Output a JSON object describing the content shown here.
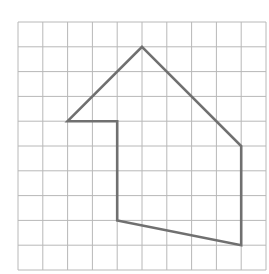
{
  "diagram": {
    "type": "grid-polygon",
    "grid": {
      "columns": 10,
      "rows": 10,
      "origin_x": 18,
      "origin_y": 22,
      "cell_size": 24.8,
      "line_color": "#b8b8b8",
      "line_width": 1
    },
    "polygon": {
      "stroke_color": "#707070",
      "stroke_width": 2.6,
      "fill": "none",
      "vertices": [
        {
          "col": 5,
          "row": 1
        },
        {
          "col": 9,
          "row": 5
        },
        {
          "col": 9,
          "row": 9
        },
        {
          "col": 4,
          "row": 8
        },
        {
          "col": 4,
          "row": 4
        },
        {
          "col": 2,
          "row": 4
        }
      ]
    }
  }
}
